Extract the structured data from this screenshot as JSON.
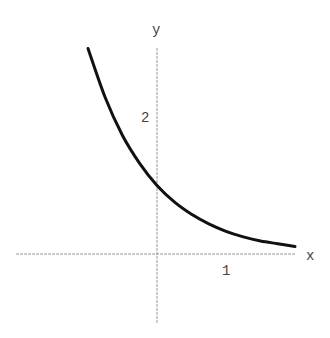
{
  "chart_data": {
    "type": "line",
    "title": "",
    "xlabel": "x",
    "ylabel": "y",
    "x_ticks": [
      "1"
    ],
    "y_ticks": [
      "2"
    ],
    "xlim": [
      -2.05,
      2.05
    ],
    "ylim": [
      -0.62,
      3.1
    ],
    "grid": false,
    "legend": null,
    "series": [
      {
        "name": "decaying exponential",
        "x": [
          -1.0,
          -0.75,
          -0.5,
          -0.25,
          0,
          0.25,
          0.5,
          0.75,
          1.0,
          1.25,
          1.5,
          1.75,
          2.0
        ],
        "y": [
          3.0,
          2.28,
          1.73,
          1.32,
          1.0,
          0.76,
          0.58,
          0.44,
          0.33,
          0.25,
          0.19,
          0.15,
          0.11
        ]
      }
    ]
  },
  "axes": {
    "x_label": "x",
    "y_label": "y",
    "x_tick_1": "1",
    "y_tick_2": "2"
  },
  "colors": {
    "curve": "#111111",
    "axis": "#9a9a9a",
    "text": "#444444"
  }
}
